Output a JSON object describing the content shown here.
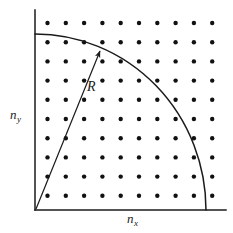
{
  "figure": {
    "type": "lattice-quarter-circle-diagram",
    "background_color": "#ffffff",
    "ink_color": "#1a1a1a",
    "width": 233,
    "height": 233
  },
  "axes": {
    "x_label_base": "n",
    "x_label_sub": "x",
    "y_label_base": "n",
    "y_label_sub": "y",
    "origin": {
      "x": 35,
      "y": 210
    },
    "x_axis_end": {
      "x": 226,
      "y": 210
    },
    "y_axis_end": {
      "x": 35,
      "y": 10
    },
    "stroke_width": 1.4
  },
  "radius": {
    "label": "R",
    "arrow_from": {
      "x": 36,
      "y": 209
    },
    "arrow_to": {
      "x": 100,
      "y": 51
    },
    "label_x": 87,
    "label_y": 80
  },
  "arc": {
    "center": {
      "x": 35,
      "y": 210
    },
    "radius_x": 171,
    "radius_y": 176,
    "start": {
      "x": 35,
      "y": 34
    },
    "end": {
      "x": 206,
      "y": 210
    },
    "stroke_width": 1.4
  },
  "lattice": {
    "columns": 10,
    "rows": 10,
    "first_x": 47.5,
    "first_y": 23,
    "spacing_x": 18.3,
    "spacing_y": 19.2,
    "dot_radius": 2.2,
    "dot_color": "#111111"
  },
  "chart_data": {
    "type": "scatter",
    "title": "",
    "xlabel": "n_x",
    "ylabel": "n_y",
    "grid": false,
    "legend": null,
    "xlim": [
      0,
      10.5
    ],
    "ylim": [
      0,
      10.5
    ],
    "series": [
      {
        "name": "lattice points",
        "marker": "filled-circle",
        "x": [
          1,
          2,
          3,
          4,
          5,
          6,
          7,
          8,
          9,
          10
        ],
        "y": [
          1,
          2,
          3,
          4,
          5,
          6,
          7,
          8,
          9,
          10
        ],
        "layout": "10x10 full grid"
      },
      {
        "name": "quarter circle of radius R",
        "marker": "arc",
        "radius": 9.2,
        "x_intercept": 9.2,
        "y_intercept": 9.2
      }
    ],
    "annotations": [
      {
        "text": "R",
        "type": "arrow-label",
        "from": [
          0,
          0
        ],
        "to": [
          3.5,
          8.3
        ]
      }
    ]
  }
}
